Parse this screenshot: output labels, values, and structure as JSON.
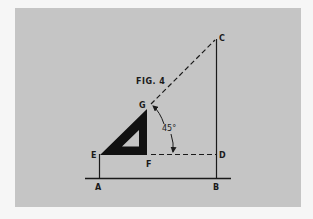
{
  "figure": {
    "title": "FIG. 4",
    "angle_label": "45°",
    "colors": {
      "background": "#f6f6f6",
      "panel": "#c5c5c5",
      "ink": "#1a1a1a"
    },
    "points": {
      "A": "A",
      "B": "B",
      "C": "C",
      "D": "D",
      "E": "E",
      "F": "F",
      "G": "G"
    },
    "elements": [
      {
        "type": "solid-line",
        "from": "A",
        "to": "E"
      },
      {
        "type": "solid-line",
        "from": "B",
        "to": "C"
      },
      {
        "type": "solid-line",
        "name": "ground-line",
        "through": [
          "A",
          "B"
        ]
      },
      {
        "type": "dashed-line",
        "from": "G",
        "to": "C"
      },
      {
        "type": "dashed-line",
        "from": "F",
        "to": "D"
      },
      {
        "type": "set-square",
        "vertices": [
          "E",
          "F",
          "G"
        ],
        "fill": "black"
      },
      {
        "type": "angle-arc",
        "between": [
          "GC",
          "FD"
        ],
        "value": "45°"
      }
    ]
  }
}
